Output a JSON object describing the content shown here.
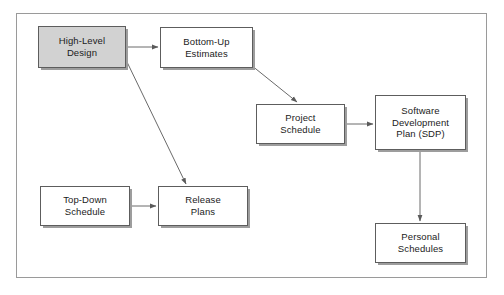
{
  "figure": {
    "kind": "flow-diagram",
    "frame": {
      "border_color": "#9a9a9a",
      "background": "#ffffff"
    },
    "palette": {
      "box_border": "#5d5d5d",
      "box_fill": "#ffffff",
      "highlight_fill": "#d2d2d2",
      "shadow": "#9d9d9d",
      "arrow": "#6a6a6a",
      "text": "#1b1b1b"
    }
  },
  "nodes": [
    {
      "id": "high-level-design",
      "label": "High-Level\nDesign",
      "highlighted": true,
      "x": 38,
      "y": 26,
      "w": 88,
      "h": 42
    },
    {
      "id": "bottom-up-estimates",
      "label": "Bottom-Up\nEstimates",
      "highlighted": false,
      "x": 160,
      "y": 27,
      "w": 93,
      "h": 41
    },
    {
      "id": "project-schedule",
      "label": "Project\nSchedule",
      "highlighted": false,
      "x": 256,
      "y": 104,
      "w": 89,
      "h": 40
    },
    {
      "id": "software-development-plan",
      "label": "Software\nDevelopment\nPlan (SDP)",
      "highlighted": false,
      "x": 375,
      "y": 95,
      "w": 91,
      "h": 55
    },
    {
      "id": "top-down-schedule",
      "label": "Top-Down\nSchedule",
      "highlighted": false,
      "x": 40,
      "y": 186,
      "w": 90,
      "h": 40
    },
    {
      "id": "release-plans",
      "label": "Release\nPlans",
      "highlighted": false,
      "x": 158,
      "y": 186,
      "w": 90,
      "h": 40
    },
    {
      "id": "personal-schedules",
      "label": "Personal\nSchedules",
      "highlighted": false,
      "x": 375,
      "y": 223,
      "w": 91,
      "h": 40
    }
  ],
  "edges": [
    {
      "id": "hld-to-bottom-up",
      "from": "high-level-design",
      "to": "bottom-up-estimates",
      "style": "horizontal"
    },
    {
      "id": "hld-to-release-plans",
      "from": "high-level-design",
      "to": "release-plans",
      "style": "diagonal"
    },
    {
      "id": "bottom-up-to-project-schedule",
      "from": "bottom-up-estimates",
      "to": "project-schedule",
      "style": "diagonal"
    },
    {
      "id": "project-schedule-to-sdp",
      "from": "project-schedule",
      "to": "software-development-plan",
      "style": "horizontal"
    },
    {
      "id": "top-down-to-release-plans",
      "from": "top-down-schedule",
      "to": "release-plans",
      "style": "horizontal"
    },
    {
      "id": "sdp-to-personal-schedules",
      "from": "software-development-plan",
      "to": "personal-schedules",
      "style": "vertical"
    }
  ],
  "chart_data": {
    "type": "diagram",
    "nodes": [
      "High-Level Design",
      "Bottom-Up Estimates",
      "Project Schedule",
      "Software Development Plan (SDP)",
      "Top-Down Schedule",
      "Release Plans",
      "Personal Schedules"
    ],
    "links": [
      [
        "High-Level Design",
        "Bottom-Up Estimates"
      ],
      [
        "High-Level Design",
        "Release Plans"
      ],
      [
        "Bottom-Up Estimates",
        "Project Schedule"
      ],
      [
        "Project Schedule",
        "Software Development Plan (SDP)"
      ],
      [
        "Top-Down Schedule",
        "Release Plans"
      ],
      [
        "Software Development Plan (SDP)",
        "Personal Schedules"
      ]
    ]
  }
}
